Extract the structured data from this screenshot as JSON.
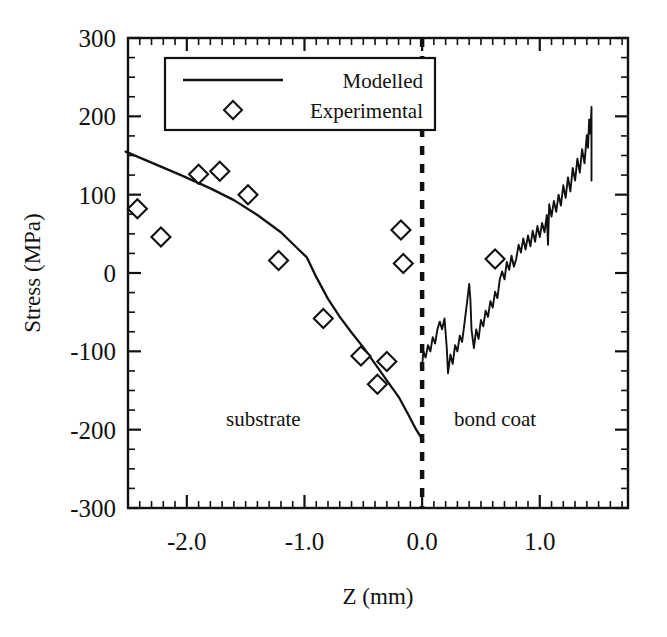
{
  "chart_data": {
    "type": "line",
    "title": "",
    "xlabel": "Z (mm)",
    "ylabel": "Stress (MPa)",
    "xlim": [
      -2.5,
      1.75
    ],
    "ylim": [
      -300,
      300
    ],
    "xticks": [
      -2.0,
      -1.0,
      0.0,
      1.0
    ],
    "xticklabels": [
      "-2.0",
      "-1.0",
      "0.0",
      "1.0"
    ],
    "yticks": [
      -300,
      -200,
      -100,
      0,
      100,
      200,
      300
    ],
    "yticklabels": [
      "-300",
      "-200",
      "-100",
      "0",
      "100",
      "200",
      "300"
    ],
    "grid": false,
    "minor_ticks": true,
    "legend": {
      "position": "top-center",
      "entries": [
        {
          "label": "Modelled",
          "marker": "line"
        },
        {
          "label": "Experimental",
          "marker": "diamond"
        }
      ]
    },
    "annotations": [
      {
        "text": "substrate",
        "x": -1.35,
        "y": -195
      },
      {
        "text": "bond coat",
        "x": 0.62,
        "y": -195
      }
    ],
    "interface_line": {
      "x": 0.0,
      "style": "dashed",
      "label": "interface"
    },
    "series": [
      {
        "name": "Modelled",
        "marker": "line",
        "style": "solid",
        "region": "substrate",
        "points": [
          [
            -2.52,
            155
          ],
          [
            -2.3,
            141
          ],
          [
            -2.05,
            125
          ],
          [
            -1.8,
            108
          ],
          [
            -1.6,
            93
          ],
          [
            -1.4,
            74
          ],
          [
            -1.2,
            52
          ],
          [
            -1.05,
            30
          ],
          [
            -0.98,
            20
          ],
          [
            -0.9,
            -5
          ],
          [
            -0.8,
            -33
          ],
          [
            -0.7,
            -56
          ],
          [
            -0.6,
            -76
          ],
          [
            -0.5,
            -95
          ],
          [
            -0.4,
            -116
          ],
          [
            -0.3,
            -137
          ],
          [
            -0.2,
            -158
          ],
          [
            -0.12,
            -180
          ],
          [
            -0.05,
            -200
          ],
          [
            0.0,
            -212
          ]
        ]
      },
      {
        "name": "Modelled",
        "marker": "line",
        "style": "solid-noisy",
        "region": "bond coat",
        "points": [
          [
            0.0,
            -120
          ],
          [
            0.01,
            -100
          ],
          [
            0.03,
            -108
          ],
          [
            0.05,
            -92
          ],
          [
            0.07,
            -100
          ],
          [
            0.09,
            -82
          ],
          [
            0.11,
            -90
          ],
          [
            0.13,
            -72
          ],
          [
            0.15,
            -62
          ],
          [
            0.17,
            -72
          ],
          [
            0.19,
            -58
          ],
          [
            0.21,
            -96
          ],
          [
            0.22,
            -128
          ],
          [
            0.24,
            -104
          ],
          [
            0.26,
            -116
          ],
          [
            0.28,
            -92
          ],
          [
            0.3,
            -100
          ],
          [
            0.32,
            -80
          ],
          [
            0.34,
            -88
          ],
          [
            0.36,
            -64
          ],
          [
            0.38,
            -40
          ],
          [
            0.4,
            -14
          ],
          [
            0.41,
            -34
          ],
          [
            0.42,
            -72
          ],
          [
            0.44,
            -96
          ],
          [
            0.46,
            -72
          ],
          [
            0.48,
            -84
          ],
          [
            0.5,
            -60
          ],
          [
            0.52,
            -68
          ],
          [
            0.54,
            -48
          ],
          [
            0.56,
            -56
          ],
          [
            0.58,
            -36
          ],
          [
            0.6,
            -44
          ],
          [
            0.62,
            -24
          ],
          [
            0.64,
            -32
          ],
          [
            0.66,
            -8
          ],
          [
            0.68,
            2
          ],
          [
            0.7,
            -8
          ],
          [
            0.72,
            14
          ],
          [
            0.74,
            4
          ],
          [
            0.76,
            22
          ],
          [
            0.78,
            8
          ],
          [
            0.8,
            18
          ],
          [
            0.82,
            36
          ],
          [
            0.84,
            26
          ],
          [
            0.86,
            44
          ],
          [
            0.88,
            30
          ],
          [
            0.9,
            48
          ],
          [
            0.92,
            34
          ],
          [
            0.94,
            54
          ],
          [
            0.96,
            40
          ],
          [
            0.98,
            60
          ],
          [
            1.0,
            46
          ],
          [
            1.02,
            64
          ],
          [
            1.04,
            52
          ],
          [
            1.06,
            74
          ],
          [
            1.07,
            36
          ],
          [
            1.08,
            88
          ],
          [
            1.1,
            72
          ],
          [
            1.12,
            92
          ],
          [
            1.14,
            78
          ],
          [
            1.16,
            100
          ],
          [
            1.18,
            86
          ],
          [
            1.2,
            112
          ],
          [
            1.22,
            96
          ],
          [
            1.24,
            122
          ],
          [
            1.26,
            104
          ],
          [
            1.28,
            134
          ],
          [
            1.3,
            118
          ],
          [
            1.32,
            146
          ],
          [
            1.34,
            128
          ],
          [
            1.36,
            158
          ],
          [
            1.38,
            140
          ],
          [
            1.4,
            176
          ],
          [
            1.41,
            160
          ],
          [
            1.42,
            196
          ],
          [
            1.43,
            178
          ],
          [
            1.44,
            212
          ],
          [
            1.44,
            118
          ]
        ]
      },
      {
        "name": "Experimental",
        "marker": "diamond",
        "points": [
          [
            -2.42,
            82
          ],
          [
            -2.22,
            46
          ],
          [
            -1.9,
            126
          ],
          [
            -1.72,
            130
          ],
          [
            -1.48,
            100
          ],
          [
            -1.22,
            16
          ],
          [
            -0.84,
            -58
          ],
          [
            -0.52,
            -106
          ],
          [
            -0.38,
            -142
          ],
          [
            -0.3,
            -113
          ],
          [
            -0.18,
            55
          ],
          [
            -0.16,
            12
          ],
          [
            0.62,
            18
          ]
        ]
      }
    ]
  },
  "plot": {
    "frame_color": "#111111",
    "line_color": "#111111",
    "marker_fill": "#ffffff"
  }
}
